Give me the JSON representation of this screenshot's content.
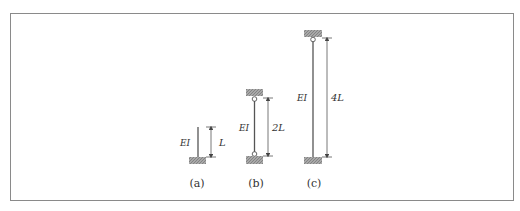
{
  "figure": {
    "columns": [
      {
        "id": "a",
        "caption": "(a)",
        "stiffness_label": "EI",
        "length_label": "L",
        "top_support": "free",
        "bottom_support": "fixed"
      },
      {
        "id": "b",
        "caption": "(b)",
        "stiffness_label": "EI",
        "length_label": "2L",
        "top_support": "pinned",
        "bottom_support": "pinned"
      },
      {
        "id": "c",
        "caption": "(c)",
        "stiffness_label": "EI",
        "length_label": "4L",
        "top_support": "pinned",
        "bottom_support": "fixed"
      }
    ]
  },
  "colors": {
    "frame": "#8a8a8a",
    "member": "#555555",
    "support_fill": "#9a9a9a",
    "text": "#333333"
  }
}
